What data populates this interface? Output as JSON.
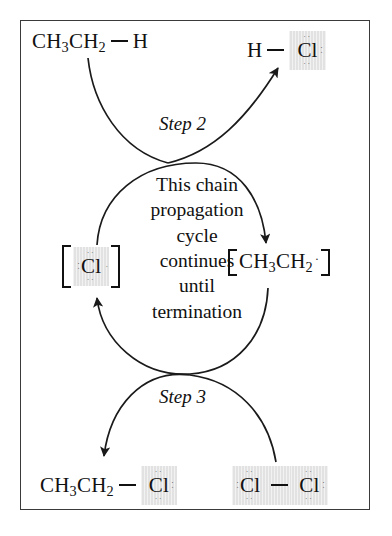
{
  "diagram": {
    "frame_color": "#3a3a3a",
    "highlight_color": "#e2e2e2",
    "text_color": "#111111",
    "dot_color": "#5c5c5c"
  },
  "center_text": {
    "lines": [
      "This chain",
      "propagation",
      "cycle",
      "continues",
      "until",
      "termination"
    ]
  },
  "steps": [
    {
      "id": "step-2",
      "label": "Step 2"
    },
    {
      "id": "step-3",
      "label": "Step 3"
    }
  ],
  "species": {
    "ethane": {
      "name": "ethane",
      "alkyl": "CH",
      "alkyl_sub1": "3",
      "alkyl_mid": "CH",
      "alkyl_sub2": "2",
      "bonded_atom": "H"
    },
    "hydrogen_chloride": {
      "name": "hydrogen-chloride",
      "hydrogen": "H",
      "chlorine": "Cl",
      "lone_pairs_top": "··",
      "lone_pairs_right": "··",
      "lone_pairs_bottom": "··"
    },
    "chlorine_radical": {
      "name": "chlorine-radical",
      "symbol": "Cl",
      "lone_pairs_top": "··",
      "lone_pairs_left": "··",
      "lone_pairs_right": "·",
      "lone_pairs_bottom": "··"
    },
    "ethyl_radical": {
      "name": "ethyl-radical",
      "alkyl": "CH",
      "alkyl_sub1": "3",
      "alkyl_mid": "CH",
      "alkyl_sub2": "2",
      "radical_dot": "·"
    },
    "chloroethane": {
      "name": "chloroethane",
      "alkyl": "CH",
      "alkyl_sub1": "3",
      "alkyl_mid": "CH",
      "alkyl_sub2": "2",
      "chlorine": "Cl",
      "lone_pairs_top": "··",
      "lone_pairs_right": "··",
      "lone_pairs_bottom": "··"
    },
    "chlorine_molecule": {
      "name": "chlorine-molecule",
      "chlorine_left": "Cl",
      "chlorine_right": "Cl",
      "left_lone_pairs_top": "··",
      "left_lone_pairs_left": "··",
      "left_lone_pairs_bottom": "··",
      "right_lone_pairs_top": "··",
      "right_lone_pairs_right": "··",
      "right_lone_pairs_bottom": "··"
    }
  },
  "arrows": [
    {
      "name": "arrow-ethane-to-hcl",
      "step": "Step 2",
      "from": "ethane",
      "to": "hydrogen-chloride"
    },
    {
      "name": "arrow-clradical-to-ethylradical",
      "step": "Step 2",
      "from": "chlorine-radical",
      "to": "ethyl-radical"
    },
    {
      "name": "arrow-ethylradical-to-clradical",
      "step": "Step 3",
      "from": "ethyl-radical",
      "to": "chlorine-radical"
    },
    {
      "name": "arrow-cl2-to-chloroethane",
      "step": "Step 3",
      "from": "chlorine-molecule",
      "to": "chloroethane"
    }
  ]
}
